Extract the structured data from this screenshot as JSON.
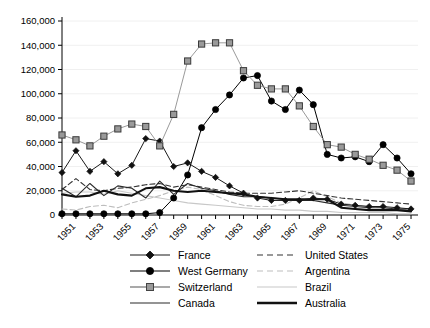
{
  "chart_data": {
    "type": "line",
    "title": "",
    "xlabel": "",
    "ylabel": "",
    "x": [
      1950,
      1951,
      1952,
      1953,
      1954,
      1955,
      1956,
      1957,
      1958,
      1959,
      1960,
      1961,
      1962,
      1963,
      1964,
      1965,
      1966,
      1967,
      1968,
      1969,
      1970,
      1971,
      1972,
      1973,
      1974,
      1975
    ],
    "xlim": [
      1950,
      1975.5
    ],
    "ylim": [
      0,
      160000
    ],
    "xticks": [
      1951,
      1953,
      1955,
      1957,
      1959,
      1961,
      1963,
      1965,
      1967,
      1969,
      1971,
      1973,
      1975
    ],
    "xtick_labels": [
      "1951",
      "1953",
      "1955",
      "1957",
      "1959",
      "1961",
      "1963",
      "1965",
      "1967",
      "1969",
      "1971",
      "1973",
      "1975"
    ],
    "yticks": [
      0,
      20000,
      40000,
      60000,
      80000,
      100000,
      120000,
      140000,
      160000
    ],
    "ytick_labels": [
      "0",
      "20,000",
      "40,000",
      "60,000",
      "80,000",
      "100,000",
      "120,000",
      "140,000",
      "160,000"
    ],
    "grid": "horizontal-light",
    "legend_position": "bottom",
    "series": [
      {
        "name": "France",
        "marker": "diamond",
        "color": "#1a1a1a",
        "line": "solid",
        "values": [
          35000,
          53000,
          36000,
          44000,
          34000,
          41000,
          63000,
          61000,
          40000,
          43000,
          36000,
          31000,
          24000,
          18000,
          14000,
          12000,
          12000,
          12000,
          14000,
          13000,
          9000,
          8000,
          7000,
          7000,
          6000,
          5000
        ]
      },
      {
        "name": "West Germany",
        "marker": "circle",
        "color": "#000000",
        "line": "solid",
        "values": [
          1000,
          1000,
          1000,
          1000,
          1000,
          1000,
          1000,
          2000,
          14000,
          33000,
          72000,
          87000,
          99000,
          113000,
          115000,
          94000,
          87000,
          103000,
          91000,
          50000,
          47000,
          48000,
          44000,
          58000,
          47000,
          34000
        ]
      },
      {
        "name": "Switzerland",
        "marker": "square",
        "color": "#9a9a9a",
        "line": "solid",
        "values": [
          66000,
          62000,
          57000,
          65000,
          71000,
          75000,
          73000,
          57000,
          83000,
          127000,
          141000,
          142000,
          142000,
          119000,
          107000,
          104000,
          104000,
          90000,
          73000,
          58000,
          56000,
          50000,
          46000,
          41000,
          37000,
          28000
        ]
      },
      {
        "name": "Canada",
        "marker": "none",
        "color": "#2b2b2b",
        "line": "thin-solid",
        "values": [
          22000,
          15000,
          26000,
          16000,
          24000,
          22000,
          14000,
          28000,
          17000,
          26000,
          22000,
          20000,
          17000,
          15000,
          15000,
          14000,
          13000,
          12000,
          12000,
          10000,
          8000,
          7000,
          6000,
          6000,
          5000,
          5000
        ]
      },
      {
        "name": "United States",
        "marker": "none",
        "color": "#333333",
        "line": "dashed",
        "values": [
          21000,
          30000,
          21000,
          20000,
          22000,
          23000,
          25000,
          26000,
          23000,
          25000,
          23000,
          21000,
          19000,
          18000,
          18000,
          18000,
          19000,
          20000,
          18000,
          16000,
          14000,
          13000,
          12000,
          11000,
          10000,
          9000
        ]
      },
      {
        "name": "Argentina",
        "marker": "none",
        "color": "#bdbdbd",
        "line": "dashed-light",
        "values": [
          5000,
          4000,
          7000,
          8000,
          6000,
          10000,
          13000,
          16000,
          20000,
          23000,
          21000,
          16000,
          11000,
          8000,
          7000,
          7000,
          9000,
          14000,
          20000,
          15000,
          10000,
          8000,
          7000,
          6000,
          5000,
          4000
        ]
      },
      {
        "name": "Brazil",
        "marker": "none",
        "color": "#c8c8c8",
        "line": "thin-light",
        "values": [
          18000,
          19000,
          19000,
          17000,
          20000,
          18000,
          16000,
          14000,
          12000,
          10000,
          9000,
          8000,
          7000,
          6000,
          5000,
          5000,
          4000,
          4000,
          3000,
          3000,
          2000,
          2000,
          2000,
          2000,
          1000,
          1000
        ]
      },
      {
        "name": "Australia",
        "marker": "none",
        "color": "#111111",
        "line": "thick-solid",
        "values": [
          17000,
          15000,
          16000,
          20000,
          17000,
          16000,
          22000,
          23000,
          20000,
          19000,
          20000,
          19000,
          18000,
          17000,
          15000,
          14000,
          13000,
          13000,
          13000,
          13000,
          6000,
          5000,
          4000,
          4000,
          4000,
          3000
        ]
      }
    ]
  },
  "legend": {
    "left_column": [
      {
        "label": "France",
        "key": "diamond-line-key"
      },
      {
        "label": "West Germany",
        "key": "circle-line-key"
      },
      {
        "label": "Switzerland",
        "key": "square-line-key"
      },
      {
        "label": "Canada",
        "key": "plain-line-key"
      }
    ],
    "right_column": [
      {
        "label": "United States",
        "key": "dashed-line-key"
      },
      {
        "label": "Argentina",
        "key": "light-dashed-line-key"
      },
      {
        "label": "Brazil",
        "key": "light-line-key"
      },
      {
        "label": "Australia",
        "key": "thick-line-key"
      }
    ]
  }
}
